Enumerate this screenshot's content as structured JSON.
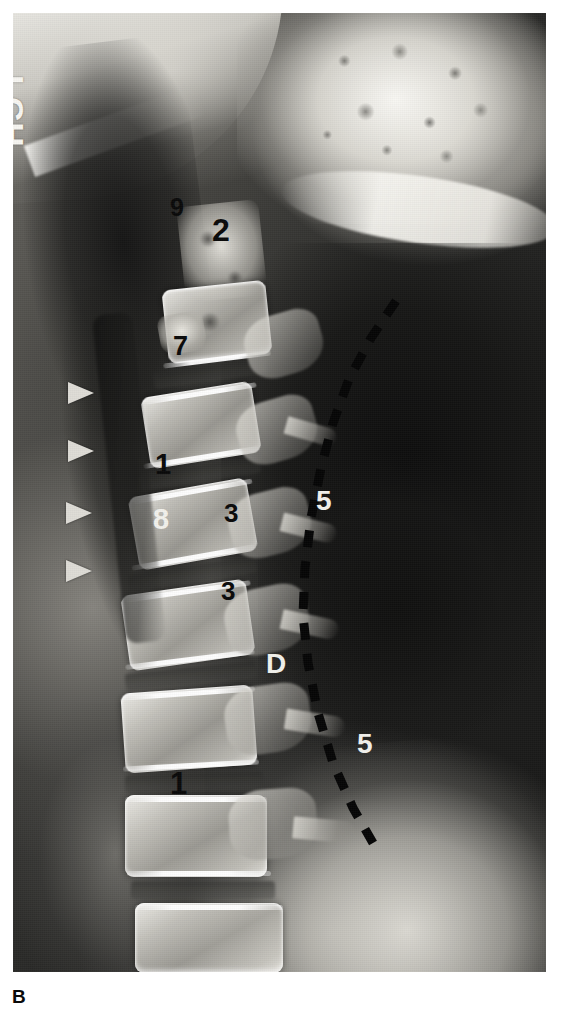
{
  "figure": {
    "caption_label": "B",
    "modality_hint": "lateral-cervical-spine-radiograph",
    "film_left": 13,
    "film_top": 13,
    "film_width": 533,
    "film_height": 959
  },
  "side_marker": {
    "text": "LCH",
    "color": "#f7f6f2",
    "x": 18,
    "y": 62,
    "font_size": 34,
    "rotation_deg": 90
  },
  "annotations": [
    {
      "id": "a9",
      "text": "9",
      "color": "dark",
      "x": 170,
      "y": 195,
      "size": 25
    },
    {
      "id": "a2",
      "text": "2",
      "color": "dark",
      "x": 212,
      "y": 214,
      "size": 32
    },
    {
      "id": "a7",
      "text": "7",
      "color": "dark",
      "x": 173,
      "y": 333,
      "size": 27
    },
    {
      "id": "a1a",
      "text": "1",
      "color": "dark",
      "x": 155,
      "y": 450,
      "size": 29
    },
    {
      "id": "a8",
      "text": "8",
      "color": "light",
      "x": 153,
      "y": 505,
      "size": 29
    },
    {
      "id": "a3a",
      "text": "3",
      "color": "dark",
      "x": 224,
      "y": 500,
      "size": 26
    },
    {
      "id": "a5a",
      "text": "5",
      "color": "light",
      "x": 316,
      "y": 487,
      "size": 28
    },
    {
      "id": "a3b",
      "text": "3",
      "color": "dark",
      "x": 221,
      "y": 578,
      "size": 26
    },
    {
      "id": "aD",
      "text": "D",
      "color": "light",
      "x": 266,
      "y": 650,
      "size": 28
    },
    {
      "id": "a5b",
      "text": "5",
      "color": "light",
      "x": 357,
      "y": 730,
      "size": 28
    },
    {
      "id": "a1b",
      "text": "1",
      "color": "dark",
      "x": 170,
      "y": 768,
      "size": 31
    }
  ],
  "arrowheads": {
    "color": "#dedcd6",
    "direction": "right",
    "items": [
      {
        "id": "arrow-1",
        "x": 68,
        "y": 382
      },
      {
        "id": "arrow-2",
        "x": 68,
        "y": 440
      },
      {
        "id": "arrow-3",
        "x": 66,
        "y": 502
      },
      {
        "id": "arrow-4",
        "x": 66,
        "y": 560
      }
    ]
  },
  "dashed_line": {
    "color": "#060606",
    "stroke_width": 9,
    "dash_pattern": "17 14",
    "path": "M 383 288 L 358 325 L 336 366 L 320 410 L 308 455 L 298 505 L 292 555 L 290 602 L 295 650 L 305 700 L 320 750 L 340 795 L 360 830"
  },
  "legend_meaning": {
    "1": "vertebral-body",
    "2": "dens-axis",
    "3": "facet-joint",
    "5": "posterior-soft-tissue-air",
    "7": "anterior-arch-atlas",
    "8": "intervertebral-disc-space",
    "9": "anterior-atlantodental-interval",
    "D": "dashed-reference-line"
  }
}
